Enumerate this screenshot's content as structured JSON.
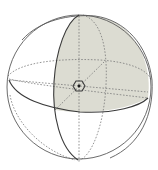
{
  "diagram": {
    "title": "Sphere with great circles and shaded octant",
    "colors": {
      "background": "#ffffff",
      "shade": "#dcdcd2",
      "line": "#5a5a5a",
      "dashed": "#7a7a7a",
      "center_point": "#1a1a1a"
    },
    "sphere": {
      "cx": 79,
      "cy": 87,
      "r": 72
    },
    "elements": [
      {
        "name": "outer-sphere-outline",
        "style": "solid"
      },
      {
        "name": "equator-front",
        "style": "solid"
      },
      {
        "name": "equator-back",
        "style": "dashed"
      },
      {
        "name": "meridian-front",
        "style": "solid"
      },
      {
        "name": "meridian-back",
        "style": "dashed"
      },
      {
        "name": "inner-axes",
        "style": "dashed"
      },
      {
        "name": "shaded-octant",
        "style": "fill"
      },
      {
        "name": "center-hexagon",
        "style": "solid"
      }
    ]
  }
}
